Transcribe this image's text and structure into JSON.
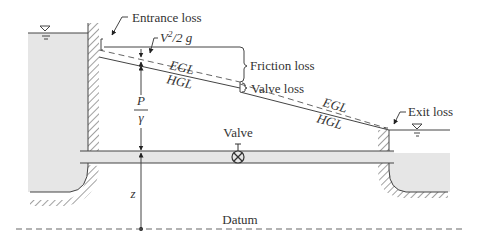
{
  "diagram": {
    "labels": {
      "entrance_loss": "Entrance loss",
      "velocity_head_base": "V",
      "velocity_head_sup": "2",
      "velocity_head_rest": "/2 g",
      "friction_loss": "Friction loss",
      "valve_loss": "Valve loss",
      "exit_loss": "Exit loss",
      "egl_upstream": "EGL",
      "hgl_upstream": "HGL",
      "egl_downstream": "EGL",
      "hgl_downstream": "HGL",
      "pressure_head_num": "P",
      "pressure_head_den": "γ",
      "elevation_head": "z",
      "valve": "Valve",
      "datum": "Datum"
    },
    "colors": {
      "water": "#e6e6e6",
      "line": "#444444",
      "text": "#333333"
    }
  }
}
